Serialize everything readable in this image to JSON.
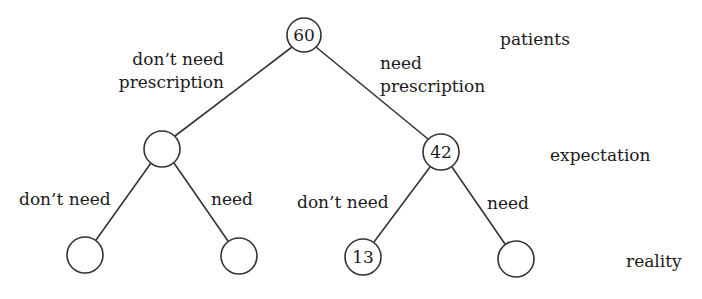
{
  "diagram": {
    "type": "tree",
    "levels": [
      {
        "id": "patients",
        "label": "patients"
      },
      {
        "id": "expectation",
        "label": "expectation"
      },
      {
        "id": "reality",
        "label": "reality"
      }
    ],
    "nodes": {
      "root": {
        "value": "60"
      },
      "exp_dont_need": {
        "value": ""
      },
      "exp_need": {
        "value": "42"
      },
      "real_dont_dont": {
        "value": ""
      },
      "real_dont_need": {
        "value": ""
      },
      "real_need_dont": {
        "value": "13"
      },
      "real_need_need": {
        "value": ""
      }
    },
    "edge_labels": {
      "root_left_line1": "don’t need",
      "root_left_line2": "prescription",
      "root_right_line1": "need",
      "root_right_line2": "prescription",
      "left_left": "don’t need",
      "left_right": "need",
      "right_left": "don’t need",
      "right_right": "need"
    }
  }
}
